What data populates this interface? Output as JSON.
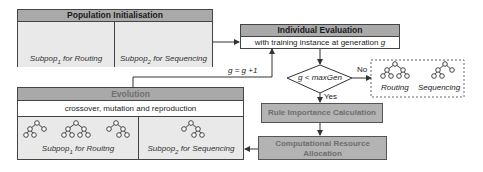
{
  "population": {
    "title": "Population Initialisation",
    "subpop1": {
      "name": "Subpop",
      "index": "1",
      "suffix": " for Routing"
    },
    "subpop2": {
      "name": "Subpop",
      "index": "2",
      "suffix": " for Sequencing"
    }
  },
  "evaluation": {
    "title": "Individual Evaluation",
    "body_prefix": "with training instance at generation ",
    "body_var": "g"
  },
  "decision": {
    "condition": "g < maxGen",
    "no_label": "No",
    "yes_label": "Yes"
  },
  "output": {
    "routing_label": "Routing",
    "sequencing_label": "Sequencing"
  },
  "increment_label": "g = g +1",
  "rule_importance": {
    "label": "Rule Importance Calculation"
  },
  "resource_allocation": {
    "line1": "Computational Resource",
    "line2": "Allocation"
  },
  "evolution": {
    "title": "Evolution",
    "body": "crossover, mutation and reproduction",
    "subpop1": {
      "name": "Subpop",
      "index": "1",
      "suffix": " for Rouitng"
    },
    "subpop2": {
      "name": "Subpop",
      "index": "2",
      "suffix": " for Sequencing"
    }
  },
  "colors": {
    "header_gray": "#a9a9a9",
    "process_gray": "#b3b3b3",
    "subpop_fill": "#e9e9e9",
    "line": "#333333"
  }
}
